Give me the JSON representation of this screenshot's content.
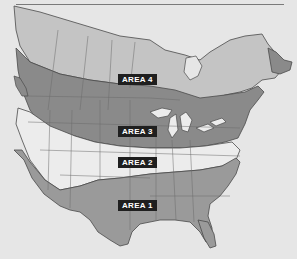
{
  "map": {
    "colors": {
      "background": "#e6e6e6",
      "area1": "#9a9a9a",
      "area2": "#ececec",
      "area3": "#8a8a8a",
      "area4": "#c4c4c4",
      "border": "#4a4a4a",
      "label_bg": "#1f1f1f",
      "label_text": "#ffffff"
    },
    "labels": [
      {
        "id": "area-4",
        "text": "AREA 4"
      },
      {
        "id": "area-3",
        "text": "AREA 3"
      },
      {
        "id": "area-2",
        "text": "AREA 2"
      },
      {
        "id": "area-1",
        "text": "AREA 1"
      }
    ]
  }
}
